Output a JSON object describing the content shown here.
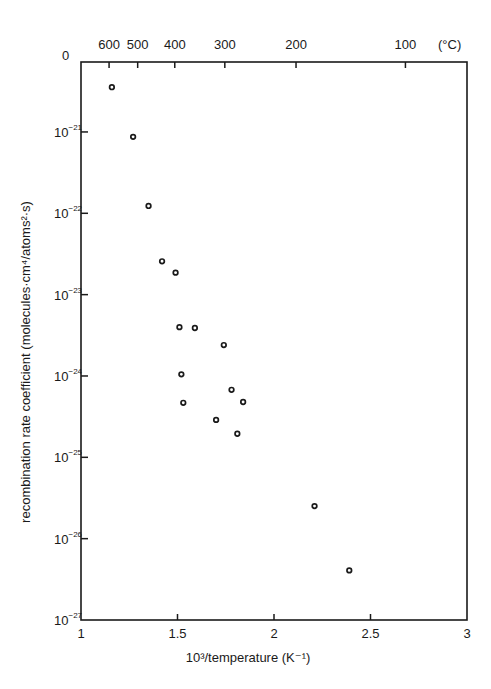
{
  "chart_data": {
    "type": "scatter",
    "title": "",
    "xlabel": "10³/temperature (K⁻¹)",
    "ylabel": "recombination rate coefficient (molecules·cm⁴/atoms²·s)",
    "xlim": [
      1,
      3
    ],
    "ylim": [
      1e-27,
      1e-20
    ],
    "yscale": "log",
    "grid": false,
    "legend": null,
    "x_ticks": [
      1,
      1.5,
      2,
      2.5,
      3
    ],
    "x_tick_labels": [
      "1",
      "1.5",
      "2",
      "2.5",
      "3"
    ],
    "y_ticks_exponents": [
      -21,
      -22,
      -23,
      -24,
      -25,
      -26,
      -27
    ],
    "y_top_label": "0",
    "secondary_x_axis": {
      "label": "(°C)",
      "ticks_celsius": [
        600,
        500,
        400,
        300,
        200,
        100
      ],
      "tick_labels": [
        "600",
        "500",
        "400",
        "300",
        "200",
        "100"
      ],
      "relation": "x = 1000 / (T°C + 273)"
    },
    "series": [
      {
        "name": "measured",
        "marker": "open-circle",
        "x": [
          1.16,
          1.27,
          1.35,
          1.42,
          1.49,
          1.51,
          1.59,
          1.74,
          1.52,
          1.78,
          1.53,
          1.84,
          1.7,
          1.81,
          2.21,
          2.39
        ],
        "log10_y": [
          -20.45,
          -21.06,
          -21.91,
          -22.59,
          -22.73,
          -23.4,
          -23.41,
          -23.62,
          -23.98,
          -24.17,
          -24.33,
          -24.32,
          -24.54,
          -24.71,
          -25.6,
          -26.39
        ],
        "y": [
          3.5e-21,
          8.7e-22,
          1.2e-22,
          2.6e-23,
          1.9e-23,
          4e-24,
          3.9e-24,
          2.4e-24,
          1.05e-24,
          6.8e-25,
          4.7e-25,
          4.8e-25,
          2.9e-25,
          1.95e-25,
          2.5e-26,
          4.1e-27
        ]
      }
    ]
  }
}
